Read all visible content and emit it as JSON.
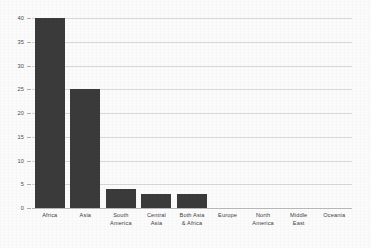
{
  "chart_data": {
    "type": "bar",
    "title": "",
    "subtitle": "",
    "xlabel": "",
    "ylabel": "",
    "categories": [
      "Africa",
      "Asia",
      "South America",
      "Central Asia",
      "Both Asia & Africa",
      "Europe",
      "North America",
      "Middle East",
      "Oceania"
    ],
    "category_lines": [
      [
        "Africa"
      ],
      [
        "Asia"
      ],
      [
        "South",
        "America"
      ],
      [
        "Central",
        "Asia"
      ],
      [
        "Both Asia",
        "& Africa"
      ],
      [
        "Europe"
      ],
      [
        "North",
        "America"
      ],
      [
        "Middle",
        "East"
      ],
      [
        "Oceania"
      ]
    ],
    "values": [
      40,
      25,
      4,
      3,
      3,
      0,
      0,
      0,
      0
    ],
    "ylim": [
      0,
      40
    ],
    "ytick_values": [
      0,
      5,
      10,
      15,
      20,
      25,
      30,
      35,
      40
    ],
    "ytick_labels": [
      "0",
      "5",
      "10",
      "15",
      "20",
      "25",
      "30",
      "35",
      "40"
    ],
    "grid": true,
    "grid_axis": "y",
    "legend": false,
    "legend_position": "none",
    "bar_color": "#3a3a3a",
    "gridline_color": "#d8d8d8",
    "axis_color": "#b9b9b9",
    "background_color": "#fbfbfb",
    "tick_label_color": "#4a4a4a"
  }
}
